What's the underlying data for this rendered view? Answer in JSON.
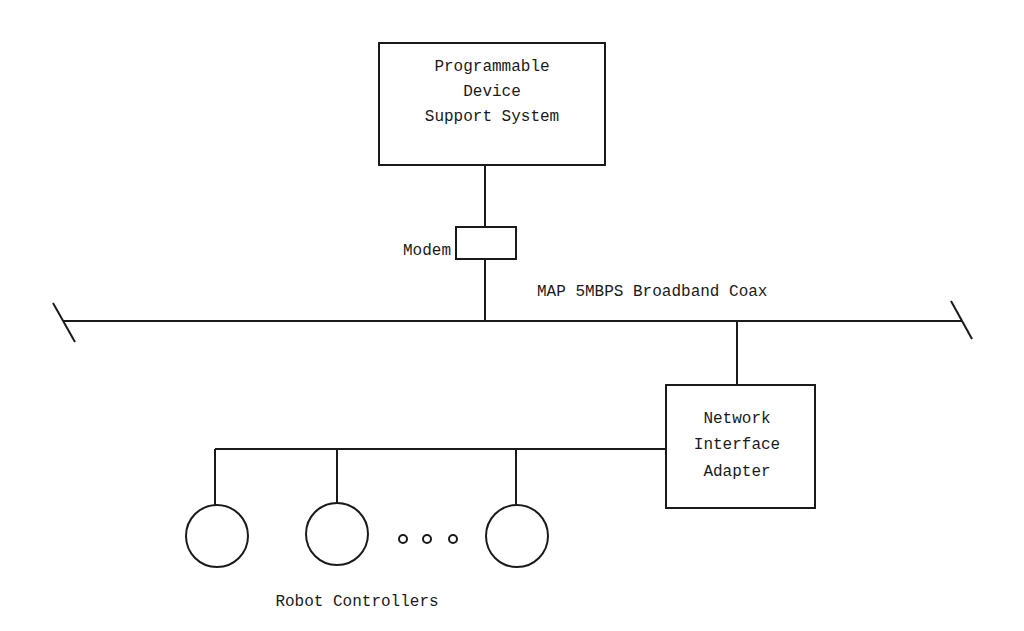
{
  "diagram": {
    "support_system": {
      "label_lines": [
        "Programmable",
        "Device",
        "Support System"
      ]
    },
    "modem": {
      "label": "Modem"
    },
    "bus": {
      "label": "MAP 5MBPS Broadband Coax"
    },
    "adapter": {
      "label_lines": [
        "Network",
        "Interface",
        "Adapter"
      ]
    },
    "controllers": {
      "label": "Robot Controllers",
      "count_shown": 3,
      "ellipsis": "o o o"
    },
    "colors": {
      "line": "#1a1a1a",
      "background": "#ffffff"
    }
  }
}
